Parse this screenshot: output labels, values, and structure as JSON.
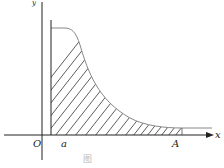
{
  "diagram": {
    "type": "shaded area under curve",
    "labels": {
      "y_axis": "y",
      "x_axis": "x",
      "origin": "O",
      "lower_bound": "a",
      "upper_bound": "A"
    },
    "caption": "图",
    "colors": {
      "axes": "#222222",
      "curve": "#888888",
      "hatch": "#333333"
    }
  }
}
